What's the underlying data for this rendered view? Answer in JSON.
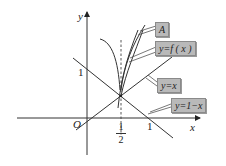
{
  "figure": {
    "axes": {
      "x_label": "x",
      "y_label": "y",
      "origin_label": "O",
      "y_tick_1": "1",
      "x_tick_1": "1",
      "x_tick_half": {
        "numerator": "1",
        "denominator": "2"
      }
    },
    "callouts": [
      {
        "id": "A",
        "text": "A"
      },
      {
        "id": "fx",
        "text": "y=f ( x )"
      },
      {
        "id": "yx",
        "text": "y=x"
      },
      {
        "id": "y1mx",
        "text": "y=1−x"
      }
    ],
    "colors": {
      "line": "#333333",
      "tag_fill": "#b9b9b9",
      "tag_border": "#8a8a8a",
      "background": "#ffffff"
    }
  }
}
